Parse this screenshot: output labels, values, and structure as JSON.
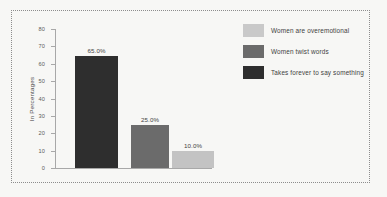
{
  "chart_data": {
    "type": "bar",
    "title": "",
    "xlabel": "",
    "ylabel": "In Percentages",
    "ylim": [
      0,
      80
    ],
    "yticks": [
      0,
      10,
      20,
      30,
      40,
      50,
      60,
      70,
      80
    ],
    "ytick_labels": [
      "0",
      "10",
      "20",
      "30",
      "40",
      "50",
      "60",
      "70",
      "80"
    ],
    "xtick_labels": [
      "",
      "",
      ""
    ],
    "grid": false,
    "legend_position": "right",
    "categories": [
      "Takes forever to say something",
      "Women twist words",
      "Women are overemotional"
    ],
    "values": [
      65.0,
      25.0,
      10.0
    ],
    "data_labels": [
      "65.0%",
      "25.0%",
      "10.0%"
    ],
    "colors": [
      "#2e2e2e",
      "#6b6b6b",
      "#c3c3c3"
    ]
  },
  "legend": {
    "items": [
      {
        "label": "Women are overemotional",
        "color": "#c9c9c9"
      },
      {
        "label": "Women twist words",
        "color": "#6b6b6b"
      },
      {
        "label": "Takes forever to say something",
        "color": "#2e2e2e"
      }
    ]
  },
  "style": {
    "background": "#f7f7f5",
    "frame_color": "#8d8d8d",
    "axis_color": "#a8a8a8",
    "text_color": "#4a4a4a"
  }
}
